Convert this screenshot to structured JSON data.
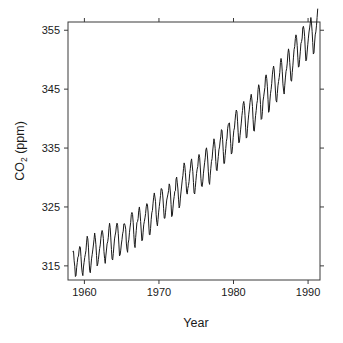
{
  "chart_data": {
    "type": "line",
    "title": "",
    "xlabel": "Year",
    "ylabel": "CO2 (ppm)",
    "ylabel_base": "CO",
    "ylabel_sub": "2",
    "ylabel_unit": " (ppm)",
    "xlim": [
      1957.8,
      1991.6
    ],
    "ylim": [
      312.6,
      356.4
    ],
    "xticks": [
      1960,
      1970,
      1980,
      1990
    ],
    "xtick_labels": [
      "1960",
      "1970",
      "1980",
      "1990"
    ],
    "yticks": [
      315,
      325,
      335,
      345,
      355
    ],
    "ytick_labels": [
      "315",
      "325",
      "335",
      "345",
      "355"
    ],
    "grid": false,
    "legend": "none",
    "line_color": "#1a1a1a",
    "line_width": 1.0,
    "axis_color": "#3a3a3a",
    "background_color": "#ffffff",
    "tick_direction": "out",
    "series": [
      {
        "name": "Mauna Loa atmospheric CO2",
        "x": [
          1958.458,
          1958.542,
          1958.625,
          1958.708,
          1958.792,
          1958.875,
          1958.958,
          1959.042,
          1959.125,
          1959.208,
          1959.292,
          1959.375,
          1959.458,
          1959.542,
          1959.625,
          1959.708,
          1959.792,
          1959.875,
          1959.958,
          1960.042,
          1960.125,
          1960.208,
          1960.292,
          1960.375,
          1960.458,
          1960.542,
          1960.625,
          1960.708,
          1960.792,
          1960.875,
          1960.958,
          1961.042,
          1961.125,
          1961.208,
          1961.292,
          1961.375,
          1961.458,
          1961.542,
          1961.625,
          1961.708,
          1961.792,
          1961.875,
          1961.958,
          1962.042,
          1962.125,
          1962.208,
          1962.292,
          1962.375,
          1962.458,
          1962.542,
          1962.625,
          1962.708,
          1962.792,
          1962.875,
          1962.958,
          1963.042,
          1963.125,
          1963.208,
          1963.292,
          1963.375,
          1963.458,
          1963.542,
          1963.625,
          1963.708,
          1963.792,
          1963.875,
          1963.958,
          1964.042,
          1964.125,
          1964.208,
          1964.292,
          1964.375,
          1964.458,
          1964.542,
          1964.625,
          1964.708,
          1964.792,
          1964.875,
          1964.958,
          1965.042,
          1965.125,
          1965.208,
          1965.292,
          1965.375,
          1965.458,
          1965.542,
          1965.625,
          1965.708,
          1965.792,
          1965.875,
          1965.958,
          1966.042,
          1966.125,
          1966.208,
          1966.292,
          1966.375,
          1966.458,
          1966.542,
          1966.625,
          1966.708,
          1966.792,
          1966.875,
          1966.958,
          1967.042,
          1967.125,
          1967.208,
          1967.292,
          1967.375,
          1967.458,
          1967.542,
          1967.625,
          1967.708,
          1967.792,
          1967.875,
          1967.958,
          1968.042,
          1968.125,
          1968.208,
          1968.292,
          1968.375,
          1968.458,
          1968.542,
          1968.625,
          1968.708,
          1968.792,
          1968.875,
          1968.958,
          1969.042,
          1969.125,
          1969.208,
          1969.292,
          1969.375,
          1969.458,
          1969.542,
          1969.625,
          1969.708,
          1969.792,
          1969.875,
          1969.958,
          1970.042,
          1970.125,
          1970.208,
          1970.292,
          1970.375,
          1970.458,
          1970.542,
          1970.625,
          1970.708,
          1970.792,
          1970.875,
          1970.958,
          1971.042,
          1971.125,
          1971.208,
          1971.292,
          1971.375,
          1971.458,
          1971.542,
          1971.625,
          1971.708,
          1971.792,
          1971.875,
          1971.958,
          1972.042,
          1972.125,
          1972.208,
          1972.292,
          1972.375,
          1972.458,
          1972.542,
          1972.625,
          1972.708,
          1972.792,
          1972.875,
          1972.958,
          1973.042,
          1973.125,
          1973.208,
          1973.292,
          1973.375,
          1973.458,
          1973.542,
          1973.625,
          1973.708,
          1973.792,
          1973.875,
          1973.958,
          1974.042,
          1974.125,
          1974.208,
          1974.292,
          1974.375,
          1974.458,
          1974.542,
          1974.625,
          1974.708,
          1974.792,
          1974.875,
          1974.958,
          1975.042,
          1975.125,
          1975.208,
          1975.292,
          1975.375,
          1975.458,
          1975.542,
          1975.625,
          1975.708,
          1975.792,
          1975.875,
          1975.958,
          1976.042,
          1976.125,
          1976.208,
          1976.292,
          1976.375,
          1976.458,
          1976.542,
          1976.625,
          1976.708,
          1976.792,
          1976.875,
          1976.958,
          1977.042,
          1977.125,
          1977.208,
          1977.292,
          1977.375,
          1977.458,
          1977.542,
          1977.625,
          1977.708,
          1977.792,
          1977.875,
          1977.958,
          1978.042,
          1978.125,
          1978.208,
          1978.292,
          1978.375,
          1978.458,
          1978.542,
          1978.625,
          1978.708,
          1978.792,
          1978.875,
          1978.958,
          1979.042,
          1979.125,
          1979.208,
          1979.292,
          1979.375,
          1979.458,
          1979.542,
          1979.625,
          1979.708,
          1979.792,
          1979.875,
          1979.958,
          1980.042,
          1980.125,
          1980.208,
          1980.292,
          1980.375,
          1980.458,
          1980.542,
          1980.625,
          1980.708,
          1980.792,
          1980.875,
          1980.958,
          1981.042,
          1981.125,
          1981.208,
          1981.292,
          1981.375,
          1981.458,
          1981.542,
          1981.625,
          1981.708,
          1981.792,
          1981.875,
          1981.958,
          1982.042,
          1982.125,
          1982.208,
          1982.292,
          1982.375,
          1982.458,
          1982.542,
          1982.625,
          1982.708,
          1982.792,
          1982.875,
          1982.958,
          1983.042,
          1983.125,
          1983.208,
          1983.292,
          1983.375,
          1983.458,
          1983.542,
          1983.625,
          1983.708,
          1983.792,
          1983.875,
          1983.958,
          1984.042,
          1984.125,
          1984.208,
          1984.292,
          1984.375,
          1984.458,
          1984.542,
          1984.625,
          1984.708,
          1984.792,
          1984.875,
          1984.958,
          1985.042,
          1985.125,
          1985.208,
          1985.292,
          1985.375,
          1985.458,
          1985.542,
          1985.625,
          1985.708,
          1985.792,
          1985.875,
          1985.958,
          1986.042,
          1986.125,
          1986.208,
          1986.292,
          1986.375,
          1986.458,
          1986.542,
          1986.625,
          1986.708,
          1986.792,
          1986.875,
          1986.958,
          1987.042,
          1987.125,
          1987.208,
          1987.292,
          1987.375,
          1987.458,
          1987.542,
          1987.625,
          1987.708,
          1987.792,
          1987.875,
          1987.958,
          1988.042,
          1988.125,
          1988.208,
          1988.292,
          1988.375,
          1988.458,
          1988.542,
          1988.625,
          1988.708,
          1988.792,
          1988.875,
          1988.958,
          1989.042,
          1989.125,
          1989.208,
          1989.292,
          1989.375,
          1989.458,
          1989.542,
          1989.625,
          1989.708,
          1989.792,
          1989.875,
          1989.958,
          1990.042,
          1990.125,
          1990.208,
          1990.292,
          1990.375,
          1990.458,
          1990.542,
          1990.625,
          1990.708,
          1990.792,
          1990.875,
          1990.958,
          1991.042,
          1991.125,
          1991.208,
          1991.292
        ],
        "values": [
          317.45,
          317.5,
          315.86,
          314.93,
          313.19,
          313.34,
          314.67,
          315.58,
          316.47,
          316.65,
          317.71,
          318.29,
          318.16,
          316.55,
          314.8,
          313.84,
          313.34,
          314.81,
          315.59,
          316.43,
          316.97,
          317.58,
          319.03,
          320.03,
          319.59,
          318.18,
          315.91,
          314.16,
          313.83,
          315.0,
          316.19,
          316.89,
          317.7,
          318.54,
          319.48,
          320.58,
          319.78,
          318.58,
          316.79,
          314.99,
          315.31,
          316.1,
          317.01,
          317.94,
          318.56,
          319.69,
          320.58,
          321.01,
          320.61,
          319.61,
          317.4,
          316.26,
          315.42,
          316.69,
          317.69,
          318.74,
          319.08,
          319.86,
          321.39,
          322.24,
          321.47,
          319.74,
          317.77,
          316.21,
          315.99,
          317.07,
          318.36,
          319.57,
          320.22,
          320.75,
          321.77,
          322.25,
          321.89,
          320.44,
          318.7,
          316.7,
          316.87,
          317.68,
          318.71,
          319.44,
          320.44,
          320.89,
          322.13,
          322.16,
          321.87,
          321.21,
          318.87,
          317.81,
          317.3,
          318.87,
          319.42,
          320.62,
          321.59,
          322.39,
          323.7,
          324.07,
          323.75,
          322.4,
          320.37,
          318.64,
          318.1,
          319.79,
          321.03,
          322.33,
          322.5,
          323.04,
          324.42,
          325.0,
          324.09,
          322.55,
          320.92,
          319.26,
          319.39,
          320.72,
          321.96,
          322.57,
          323.15,
          323.89,
          325.02,
          325.57,
          325.36,
          324.14,
          322.11,
          320.33,
          320.25,
          321.32,
          322.9,
          324.0,
          324.42,
          325.64,
          326.66,
          327.38,
          326.7,
          325.89,
          323.67,
          322.38,
          321.78,
          322.85,
          324.12,
          325.06,
          325.98,
          326.93,
          328.13,
          328.07,
          327.66,
          326.35,
          324.69,
          323.1,
          323.07,
          324.01,
          325.13,
          326.17,
          326.68,
          327.18,
          327.78,
          328.92,
          328.57,
          327.37,
          325.43,
          323.36,
          323.56,
          324.8,
          326.01,
          326.77,
          327.63,
          327.75,
          329.72,
          330.07,
          329.09,
          328.05,
          326.32,
          324.84,
          325.2,
          326.5,
          327.55,
          328.55,
          329.56,
          330.3,
          331.5,
          332.48,
          332.07,
          330.87,
          329.31,
          327.51,
          327.18,
          328.16,
          328.64,
          329.35,
          330.71,
          331.48,
          332.65,
          333.16,
          332.13,
          330.99,
          329.17,
          327.41,
          327.2,
          328.33,
          329.5,
          330.68,
          331.41,
          331.85,
          333.29,
          333.91,
          333.4,
          331.78,
          329.88,
          328.57,
          328.46,
          329.26,
          330.62,
          331.6,
          332.5,
          333.33,
          334.67,
          335.04,
          334.32,
          332.97,
          330.96,
          329.27,
          328.83,
          330.4,
          331.57,
          332.71,
          333.18,
          334.49,
          335.53,
          336.57,
          336.06,
          334.9,
          332.69,
          331.26,
          331.15,
          332.48,
          333.55,
          334.7,
          335.19,
          336.2,
          336.9,
          338.12,
          338.03,
          336.41,
          334.42,
          332.37,
          332.41,
          333.75,
          334.9,
          336.14,
          336.69,
          338.27,
          338.96,
          339.21,
          339.26,
          337.54,
          335.75,
          333.98,
          334.19,
          335.31,
          336.81,
          338.0,
          338.42,
          339.7,
          340.82,
          341.46,
          341.17,
          339.56,
          337.6,
          335.88,
          336.01,
          337.1,
          338.21,
          339.24,
          340.48,
          341.38,
          342.51,
          342.91,
          342.25,
          340.49,
          338.43,
          336.69,
          336.85,
          338.36,
          339.61,
          340.75,
          341.61,
          342.7,
          343.56,
          344.13,
          343.35,
          342.06,
          339.82,
          337.97,
          337.86,
          339.26,
          340.49,
          341.37,
          342.52,
          343.1,
          344.94,
          345.75,
          345.32,
          343.99,
          342.39,
          339.86,
          339.99,
          341.16,
          342.99,
          343.7,
          344.51,
          345.28,
          347.08,
          347.43,
          346.79,
          345.4,
          343.28,
          341.07,
          341.35,
          342.98,
          344.22,
          344.97,
          345.99,
          347.42,
          348.35,
          348.93,
          348.25,
          346.56,
          344.69,
          343.09,
          342.8,
          344.24,
          345.56,
          346.3,
          346.95,
          347.85,
          349.55,
          350.21,
          349.55,
          347.94,
          345.9,
          344.85,
          344.17,
          345.66,
          346.9,
          348.02,
          348.47,
          349.42,
          350.99,
          351.84,
          351.25,
          349.52,
          348.1,
          346.44,
          346.36,
          347.81,
          348.96,
          350.43,
          351.72,
          352.22,
          353.59,
          354.22,
          353.79,
          352.38,
          350.43,
          348.73,
          348.88,
          350.07,
          351.34,
          352.76,
          353.07,
          353.68,
          355.42,
          355.67,
          355.13,
          353.9,
          351.67,
          349.8,
          349.99,
          351.3,
          352.53,
          353.66,
          354.7,
          355.39,
          356.2,
          357.16,
          356.22,
          354.82,
          352.91,
          350.96,
          351.18,
          352.83,
          354.21,
          354.72,
          355.75,
          357.16,
          358.6
        ]
      }
    ]
  },
  "figure": {
    "plot_left_px": 68,
    "plot_right_px": 320,
    "plot_top_px": 22,
    "plot_bottom_px": 280
  }
}
